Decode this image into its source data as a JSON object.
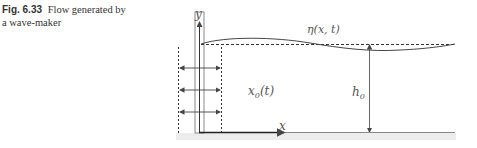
{
  "caption": {
    "figure_number": "Fig. 6.33",
    "text_line1": "Flow generated by",
    "text_line2": "a wave-maker"
  },
  "diagram": {
    "labels": {
      "y_axis": "y",
      "x_axis": "x",
      "surface_elevation": "η(x, t)",
      "paddle_position": "x",
      "paddle_position_sub": "0",
      "paddle_position_arg": "(t)",
      "depth": "h",
      "depth_sub": "0"
    },
    "colors": {
      "line": "#444444",
      "dashed": "#333333",
      "paddle": "#777777",
      "ground": "#e4e4e4"
    }
  }
}
